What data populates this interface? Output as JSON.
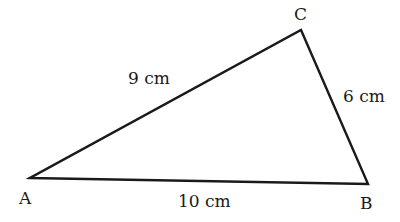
{
  "diagram": {
    "type": "triangle",
    "vertices": [
      {
        "name": "A",
        "x": 30,
        "y": 178
      },
      {
        "name": "B",
        "x": 368,
        "y": 184
      },
      {
        "name": "C",
        "x": 301,
        "y": 30
      }
    ],
    "vertex_labels": {
      "A": "A",
      "B": "B",
      "C": "C"
    },
    "sides": {
      "AC": "9 cm",
      "CB": "6 cm",
      "AB": "10 cm"
    },
    "stroke_color": "#1a1a1a"
  }
}
